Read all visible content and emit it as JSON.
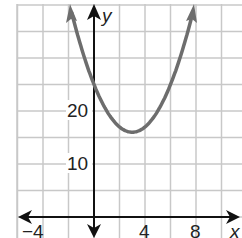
{
  "chart_data": {
    "type": "line",
    "title": "",
    "xlabel": "x",
    "ylabel": "y",
    "function": "y = x^2 - 6x + 25",
    "xlim": [
      -6,
      11.5
    ],
    "ylim": [
      -4,
      40
    ],
    "x_ticks": [
      -4,
      4,
      8
    ],
    "y_ticks": [
      10,
      20
    ],
    "grid": true,
    "grid_x_step": 2,
    "grid_y_step": 5,
    "vertex": [
      3,
      16
    ],
    "y_intercept": 25,
    "x": [
      -1.9,
      -1,
      0,
      1,
      2,
      3,
      4,
      5,
      6,
      7,
      7.9
    ],
    "y": [
      40,
      32,
      25,
      20,
      17,
      16,
      17,
      20,
      25,
      32,
      40
    ],
    "curve_color": "#6d6d6d",
    "axis_color": "#111111",
    "grid_color": "#c8c8c8"
  },
  "labels": {
    "x_axis_name": "x",
    "y_axis_name": "y",
    "tick_x_neg4": "−4",
    "tick_x_4": "4",
    "tick_x_8": "8",
    "tick_y_10": "10",
    "tick_y_20": "20"
  }
}
